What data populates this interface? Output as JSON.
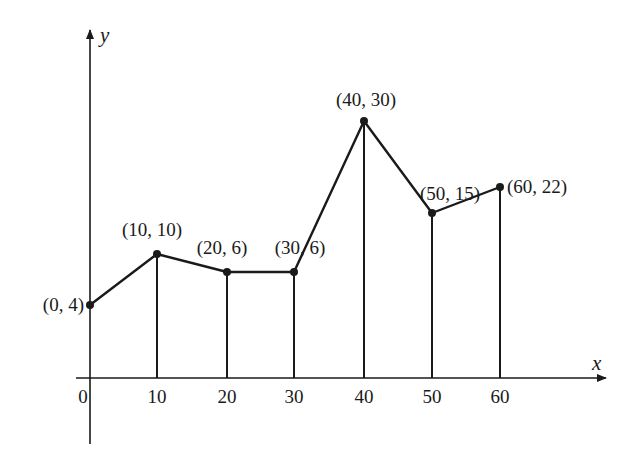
{
  "chart_data": {
    "type": "line",
    "title": "",
    "xlabel": "x",
    "ylabel": "y",
    "x": [
      0,
      10,
      20,
      30,
      40,
      50,
      60
    ],
    "values": [
      4,
      10,
      6,
      6,
      30,
      15,
      22
    ],
    "x_ticks": [
      "0",
      "10",
      "20",
      "30",
      "40",
      "50",
      "60"
    ],
    "point_labels": [
      "(0, 4)",
      "(10, 10)",
      "(20, 6)",
      "(30, 6)",
      "(40, 30)",
      "(50, 15)",
      "(60, 22)"
    ],
    "vertical_lines_to_axis": true,
    "grid": false,
    "legend": null,
    "note": "Piecewise-linear graph with vertical segments from each point down to the x-axis (trapezoid partition); not drawn to scale",
    "pixel_points": [
      [
        90,
        305
      ],
      [
        157,
        254
      ],
      [
        227,
        272
      ],
      [
        294,
        272
      ],
      [
        364,
        121
      ],
      [
        432,
        213
      ],
      [
        500,
        187
      ]
    ]
  },
  "colors": {
    "line": "#1a1a1a",
    "background": "#ffffff"
  }
}
